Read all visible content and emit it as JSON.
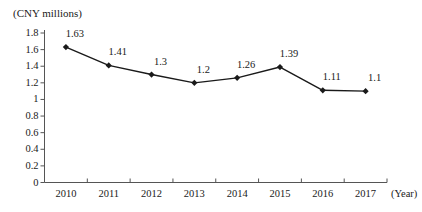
{
  "chart_data": {
    "type": "line",
    "title": "",
    "unit_caption": "(CNY millions)",
    "xlabel": "(Year)",
    "ylabel": "",
    "categories": [
      "2010",
      "2011",
      "2012",
      "2013",
      "2014",
      "2015",
      "2016",
      "2017"
    ],
    "values": [
      1.63,
      1.41,
      1.3,
      1.2,
      1.26,
      1.39,
      1.11,
      1.1
    ],
    "point_labels": [
      "1.63",
      "1.41",
      "1.3",
      "1.2",
      "1.26",
      "1.39",
      "1.11",
      "1.1"
    ],
    "ylim": [
      0,
      1.8
    ],
    "y_ticks": [
      "1.8",
      "1.6",
      "1.4",
      "1.2",
      "1",
      "0.8",
      "0.6",
      "0.4",
      "0.2",
      "0"
    ],
    "y_tick_values": [
      1.8,
      1.6,
      1.4,
      1.2,
      1.0,
      0.8,
      0.6,
      0.4,
      0.2,
      0
    ],
    "grid": false,
    "legend": false,
    "legend_position": "none",
    "marker": "diamond",
    "line_color": "#1a1a1a",
    "marker_color": "#1a1a1a",
    "axis_color": "#555555",
    "background_color": "#ffffff"
  }
}
